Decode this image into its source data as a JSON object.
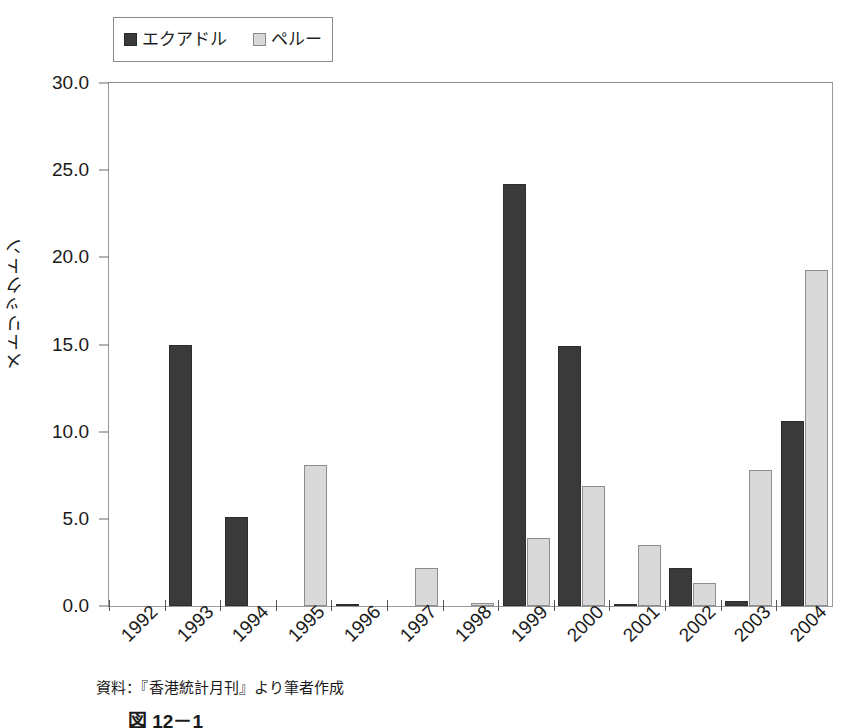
{
  "chart_data": {
    "type": "bar",
    "title": "",
    "xlabel": "",
    "ylabel": "メトリックトン",
    "ylim": [
      0,
      30
    ],
    "yticks": [
      "0.0",
      "5.0",
      "10.0",
      "15.0",
      "20.0",
      "25.0",
      "30.0"
    ],
    "ytick_values": [
      0,
      5,
      10,
      15,
      20,
      25,
      30
    ],
    "grid": false,
    "legend_position": "top-left",
    "categories": [
      "1992",
      "1993",
      "1994",
      "1995",
      "1996",
      "1997",
      "1998",
      "1999",
      "2000",
      "2001",
      "2002",
      "2003",
      "2004"
    ],
    "series": [
      {
        "name": "エクアドル",
        "color": "#3a3a3a",
        "values": [
          0.0,
          15.0,
          5.1,
          0.0,
          0.1,
          0.0,
          0.0,
          24.2,
          14.9,
          0.1,
          2.2,
          0.3,
          10.6
        ]
      },
      {
        "name": "ペルー",
        "color": "#d9d9d9",
        "values": [
          0.0,
          0.0,
          0.0,
          8.1,
          0.0,
          2.2,
          0.2,
          3.9,
          6.9,
          3.5,
          1.3,
          7.8,
          19.3
        ]
      }
    ]
  },
  "legend": {
    "entries": [
      {
        "label": "エクアドル",
        "swatch": "dark"
      },
      {
        "label": "ペルー",
        "swatch": "light"
      }
    ]
  },
  "axis": {
    "y_title": "メトリックトン"
  },
  "notes": {
    "source": "資料：『香港統計月刊』より筆者作成",
    "figure_caption": "図 12－1"
  }
}
